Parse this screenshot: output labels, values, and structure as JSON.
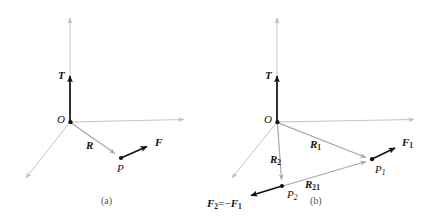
{
  "figure": {
    "background_color": "#ffffff",
    "axis_color": "#b9b9b9",
    "vector_gray_color": "#a0a0a0",
    "vector_black_color": "#111111",
    "panels": [
      {
        "id": "a",
        "caption": "(a)",
        "origin_label": "O",
        "axes": [
          {
            "name": "vertical-axis",
            "from": [
              70,
              122
            ],
            "to": [
              70,
              14
            ]
          },
          {
            "name": "horizontal-axis",
            "from": [
              70,
              122
            ],
            "to": [
              190,
              119
            ]
          },
          {
            "name": "diagonal-axis",
            "from": [
              70,
              122
            ],
            "to": [
              22,
              183
            ]
          }
        ],
        "vectors": [
          {
            "name": "T",
            "label": "T",
            "color": "black",
            "from": [
              70,
              122
            ],
            "to": [
              70,
              70
            ]
          },
          {
            "name": "R",
            "label": "R",
            "color": "gray",
            "from": [
              70,
              122
            ],
            "to": [
              120,
              157
            ]
          },
          {
            "name": "F",
            "label": "F",
            "color": "black",
            "from": [
              121,
              158
            ],
            "to": [
              152,
              144
            ]
          }
        ],
        "points": [
          {
            "name": "P",
            "label": "P",
            "at": [
              121,
              158
            ]
          }
        ]
      },
      {
        "id": "b",
        "caption": "(b)",
        "origin_label": "O",
        "axes": [
          {
            "name": "vertical-axis",
            "from": [
              277,
              122
            ],
            "to": [
              277,
              14
            ]
          },
          {
            "name": "horizontal-axis",
            "from": [
              277,
              122
            ],
            "to": [
              420,
              119
            ]
          },
          {
            "name": "diagonal-axis",
            "from": [
              277,
              122
            ],
            "to": [
              228,
              183
            ]
          }
        ],
        "vectors": [
          {
            "name": "T",
            "label": "T",
            "color": "black",
            "from": [
              277,
              122
            ],
            "to": [
              277,
              70
            ]
          },
          {
            "name": "R1",
            "label": "R",
            "sub": "1",
            "color": "gray",
            "from": [
              277,
              122
            ],
            "to": [
              371,
              159
            ]
          },
          {
            "name": "R2",
            "label": "R",
            "sub": "2",
            "color": "gray",
            "from": [
              277,
              122
            ],
            "to": [
              282,
              185
            ]
          },
          {
            "name": "R21",
            "label": "R",
            "sub": "21",
            "color": "gray",
            "from": [
              283,
              186
            ],
            "to": [
              371,
              160
            ]
          },
          {
            "name": "F1",
            "label": "F",
            "sub": "1",
            "color": "black",
            "from": [
              372,
              159
            ],
            "to": [
              400,
              145
            ]
          },
          {
            "name": "F2",
            "label": "F",
            "sub": "2",
            "color": "black",
            "from": [
              282,
              186
            ],
            "to": [
              246,
              197
            ]
          }
        ],
        "points": [
          {
            "name": "P1",
            "label": "P",
            "sub": "1",
            "at": [
              372,
              159
            ]
          },
          {
            "name": "P2",
            "label": "P",
            "sub": "2",
            "at": [
              282,
              186
            ]
          }
        ],
        "equation": {
          "lhs": "F",
          "lhs_sub": "2",
          "operator": "=",
          "rhs_sign": "−",
          "rhs": "F",
          "rhs_sub": "1",
          "full_text": "F2 = -F1"
        }
      }
    ],
    "labels": {
      "a_T": "T",
      "a_O": "O",
      "a_R": "R",
      "a_F": "F",
      "a_P": "P",
      "a_caption": "(a)",
      "b_T": "T",
      "b_O": "O",
      "b_R1": "R",
      "b_R1_sub": "1",
      "b_R2": "R",
      "b_R2_sub": "2",
      "b_R21": "R",
      "b_R21_sub": "21",
      "b_F1": "F",
      "b_F1_sub": "1",
      "b_P1": "P",
      "b_P1_sub": "1",
      "b_P2": "P",
      "b_P2_sub": "2",
      "b_F2": "F",
      "b_F2_sub": "2",
      "b_eq": "=",
      "b_minus": "−",
      "b_F1_rhs": "F",
      "b_F1_rhs_sub": "1",
      "b_caption": "(b)"
    }
  }
}
